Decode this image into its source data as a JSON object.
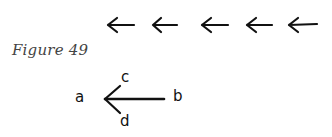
{
  "figure": {
    "caption": "Figure 49"
  },
  "arrow_row": {
    "count": 5,
    "direction": "left",
    "arrows": [
      {
        "x1": 134,
        "x2": 108,
        "y": 25
      },
      {
        "x1": 177,
        "x2": 153,
        "y": 25
      },
      {
        "x1": 228,
        "x2": 202,
        "y": 25
      },
      {
        "x1": 272,
        "x2": 247,
        "y": 25
      },
      {
        "x1": 317,
        "x2": 289,
        "y": 25
      }
    ]
  },
  "diagram": {
    "labels": {
      "a": "a",
      "b": "b",
      "c": "c",
      "d": "d"
    },
    "arrow": {
      "tip": [
        105,
        99
      ],
      "tail": [
        164,
        99
      ],
      "upper_barb_end": [
        120,
        86
      ],
      "lower_barb_end": [
        120,
        113
      ]
    }
  },
  "colors": {
    "ink": "#111111",
    "caption": "#444444",
    "background": "#ffffff"
  }
}
